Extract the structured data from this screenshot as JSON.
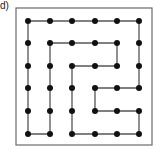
{
  "label": "d)",
  "colors": {
    "frame": "#6b6b6b",
    "line": "#555555",
    "dot": "#111111",
    "background": "#ffffff"
  },
  "frame": {
    "x": 16,
    "y": 8,
    "width": 136,
    "height": 137
  },
  "grid": {
    "cols": 6,
    "rows": 6,
    "x": [
      28,
      50,
      72,
      95,
      117,
      139
    ],
    "y": [
      21,
      43,
      66,
      88,
      111,
      134
    ],
    "dot_radius": 3
  },
  "path": [
    [
      1,
      5
    ],
    [
      0,
      5
    ],
    [
      0,
      4
    ],
    [
      0,
      3
    ],
    [
      0,
      2
    ],
    [
      0,
      1
    ],
    [
      0,
      0
    ],
    [
      1,
      0
    ],
    [
      2,
      0
    ],
    [
      3,
      0
    ],
    [
      4,
      0
    ],
    [
      5,
      0
    ],
    [
      5,
      1
    ],
    [
      5,
      2
    ],
    [
      5,
      3
    ],
    [
      4,
      3
    ],
    [
      3,
      3
    ],
    [
      3,
      4
    ],
    [
      4,
      4
    ],
    [
      5,
      4
    ],
    [
      5,
      5
    ],
    [
      4,
      5
    ],
    [
      3,
      5
    ],
    [
      2,
      5
    ],
    [
      2,
      4
    ],
    [
      2,
      3
    ],
    [
      2,
      2
    ],
    [
      3,
      2
    ],
    [
      4,
      2
    ],
    [
      4,
      1
    ],
    [
      3,
      1
    ],
    [
      2,
      1
    ],
    [
      1,
      1
    ],
    [
      1,
      2
    ],
    [
      1,
      3
    ],
    [
      1,
      4
    ],
    [
      1,
      5
    ]
  ]
}
